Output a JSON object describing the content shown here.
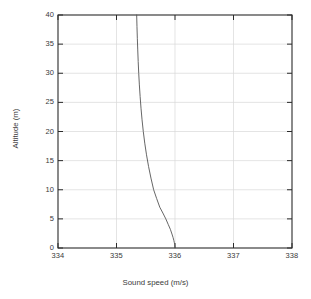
{
  "chart_data": {
    "type": "line",
    "title": "",
    "xlabel": "Sound speed (m/s)",
    "ylabel": "Altitude (m)",
    "xlim": [
      334,
      338
    ],
    "ylim": [
      0,
      40
    ],
    "xticks": [
      334,
      335,
      336,
      337,
      338
    ],
    "yticks": [
      0,
      5,
      10,
      15,
      20,
      25,
      30,
      35,
      40
    ],
    "xtick_labels": [
      "334",
      "335",
      "336",
      "337",
      "338"
    ],
    "ytick_labels": [
      "0",
      "5",
      "10",
      "15",
      "20",
      "25",
      "30",
      "35",
      "40"
    ],
    "grid": true,
    "legend": null,
    "series": [
      {
        "name": "sound speed profile",
        "color": "#555555",
        "x": [
          335.345,
          335.35,
          335.356,
          335.363,
          335.371,
          335.38,
          335.391,
          335.404,
          335.419,
          335.437,
          335.458,
          335.483,
          335.513,
          335.548,
          335.589,
          335.635,
          335.686,
          335.74,
          335.793,
          335.843,
          335.886,
          335.921,
          335.948,
          335.967,
          335.98,
          335.989,
          335.994,
          335.997,
          335.999,
          336.0
        ],
        "y": [
          40.0,
          38.0,
          36.0,
          34.0,
          32.0,
          30.0,
          28.0,
          26.0,
          24.0,
          22.0,
          20.0,
          18.0,
          16.0,
          14.0,
          12.0,
          10.0,
          8.5,
          7.0,
          6.0,
          5.0,
          4.0,
          3.2,
          2.4,
          1.8,
          1.3,
          0.9,
          0.6,
          0.35,
          0.15,
          0.0
        ]
      }
    ],
    "axis_color": "#2b2b2b",
    "grid_color": "#d9d9d9",
    "background": "#ffffff"
  },
  "geometry": {
    "plot_left": 58,
    "plot_right": 292,
    "plot_top": 15,
    "plot_bottom": 248
  }
}
